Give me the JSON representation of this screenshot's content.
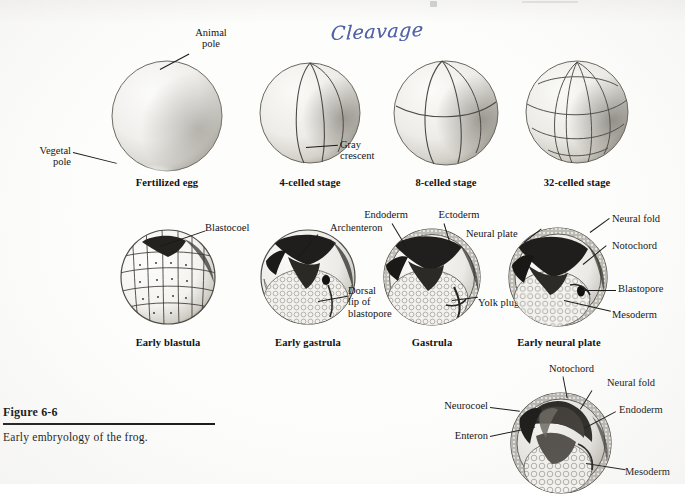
{
  "figure": {
    "number": "Figure 6-6",
    "caption": "Early embryology of the frog."
  },
  "annotation": {
    "handwritten_note": "Cleavage",
    "ink_color": "#3a4d9c"
  },
  "rows": {
    "top_row": {
      "stages": [
        {
          "caption": "Fertilized egg",
          "labels": [
            "Animal\npole",
            "Vegetal\npole"
          ],
          "label_animal": "Animal",
          "label_animal2": "pole",
          "label_vegetal": "Vegetal",
          "label_vegetal2": "pole"
        },
        {
          "caption": "4-celled stage",
          "label_gray": "Gray",
          "label_gray2": "crescent"
        },
        {
          "caption": "8-celled stage"
        },
        {
          "caption": "32-celled stage"
        }
      ]
    },
    "middle_row": {
      "stages": [
        {
          "caption": "Early blastula",
          "label_blastocoel": "Blastocoel"
        },
        {
          "caption": "Early gastrula",
          "label_archenteron": "Archenteron",
          "label_dorsal1": "Dorsal",
          "label_dorsal2": "lip of",
          "label_dorsal3": "blastopore"
        },
        {
          "caption": "Gastrula",
          "label_endoderm": "Endoderm",
          "label_ectoderm": "Ectoderm",
          "label_yolkplug": "Yolk plug"
        },
        {
          "caption": "Early neural plate",
          "label_neuralplate": "Neural plate",
          "label_neuralfold": "Neural fold",
          "label_notochord": "Notochord",
          "label_blastopore": "Blastopore",
          "label_mesoderm": "Mesoderm"
        }
      ]
    },
    "bottom_row": {
      "stages": [
        {
          "caption": "",
          "label_notochord": "Notochord",
          "label_neuralfold": "Neural fold",
          "label_endoderm": "Endoderm",
          "label_neurocoel": "Neurocoel",
          "label_enteron": "Enteron",
          "label_mesoderm": "Mesoderm"
        }
      ]
    }
  }
}
